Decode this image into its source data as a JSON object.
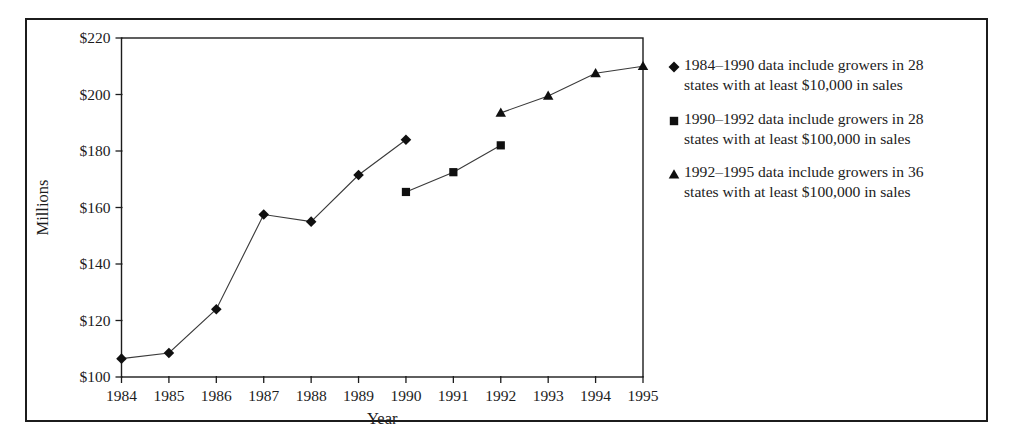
{
  "chart_data": {
    "type": "line",
    "title": "",
    "subtitle": "",
    "xlabel": "Year",
    "ylabel": "Millions",
    "x": [
      1984,
      1985,
      1986,
      1987,
      1988,
      1989,
      1990,
      1991,
      1992,
      1993,
      1994,
      1995
    ],
    "xtick_labels": [
      "1984",
      "1985",
      "1986",
      "1987",
      "1988",
      "1989",
      "1990",
      "1991",
      "1992",
      "1993",
      "1994",
      "1995"
    ],
    "xlim": [
      1984,
      1995
    ],
    "ylim": [
      100,
      220
    ],
    "ytick_values": [
      100,
      120,
      140,
      160,
      180,
      200,
      220
    ],
    "ytick_labels": [
      "$100",
      "$120",
      "$140",
      "$160",
      "$180",
      "$200",
      "$220"
    ],
    "grid": false,
    "legend_position": "right",
    "series": [
      {
        "name": "1984–1990 data include growers in 28 states with at least $10,000 in sales",
        "marker": "diamond",
        "x": [
          1984,
          1985,
          1986,
          1987,
          1988,
          1989,
          1990
        ],
        "values": [
          106.5,
          108.5,
          124,
          157.5,
          155,
          171.5,
          184
        ]
      },
      {
        "name": "1990–1992 data include growers in 28 states with at least $100,000 in sales",
        "marker": "square",
        "x": [
          1990,
          1991,
          1992
        ],
        "values": [
          165.5,
          172.5,
          182
        ]
      },
      {
        "name": "1992–1995 data include growers in 36 states with at least $100,000 in sales",
        "marker": "triangle",
        "x": [
          1992,
          1993,
          1994,
          1995
        ],
        "values": [
          193.5,
          199.5,
          207.5,
          210
        ]
      }
    ]
  },
  "legend": {
    "entries": [
      {
        "marker": "diamond-marker-icon",
        "line1": "1984–1990 data include growers in 28",
        "line2": "states with at least $10,000 in sales",
        "text": "1984–1990 data include growers in 28 states with at least $10,000 in sales"
      },
      {
        "marker": "square-marker-icon",
        "line1": "1990–1992 data include growers in 28",
        "line2": "states with at least $100,000 in sales",
        "text": "1990–1992 data include growers in 28 states with at least $100,000 in sales"
      },
      {
        "marker": "triangle-marker-icon",
        "line1": "1992–1995 data include growers in 36",
        "line2": "states with at least $100,000 in sales",
        "text": "1992–1995 data include growers in 36 states with at least $100,000 in sales"
      }
    ]
  },
  "colors": {
    "ink": "#1c1c1c",
    "marker": "#101010",
    "line": "#3a3a3a",
    "background": "#ffffff"
  }
}
